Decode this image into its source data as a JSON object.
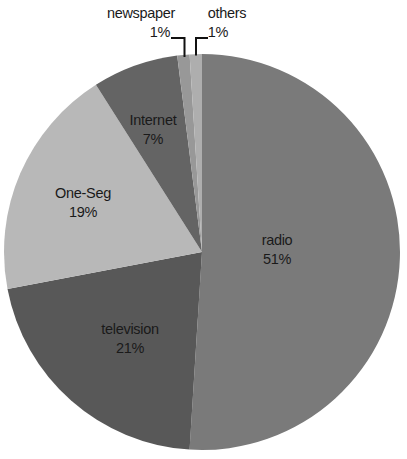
{
  "chart_data": {
    "type": "pie",
    "title": "",
    "unit": "%",
    "start_angle_deg": 0,
    "direction": "clockwise",
    "legend": "none",
    "background": "#ffffff",
    "label_color": "#1a1a1a",
    "slices": [
      {
        "label": "radio",
        "value": 51,
        "pct_label": "51%",
        "color": "#7a7a7a",
        "label_placement": "inside"
      },
      {
        "label": "television",
        "value": 21,
        "pct_label": "21%",
        "color": "#585858",
        "label_placement": "inside"
      },
      {
        "label": "One-Seg",
        "value": 19,
        "pct_label": "19%",
        "color": "#b8b8b8",
        "label_placement": "inside"
      },
      {
        "label": "Internet",
        "value": 7,
        "pct_label": "7%",
        "color": "#646464",
        "label_placement": "inside"
      },
      {
        "label": "newspaper",
        "value": 1,
        "pct_label": "1%",
        "color": "#989898",
        "label_placement": "outside"
      },
      {
        "label": "others",
        "value": 1,
        "pct_label": "1%",
        "color": "#aeaeae",
        "label_placement": "outside"
      }
    ]
  }
}
